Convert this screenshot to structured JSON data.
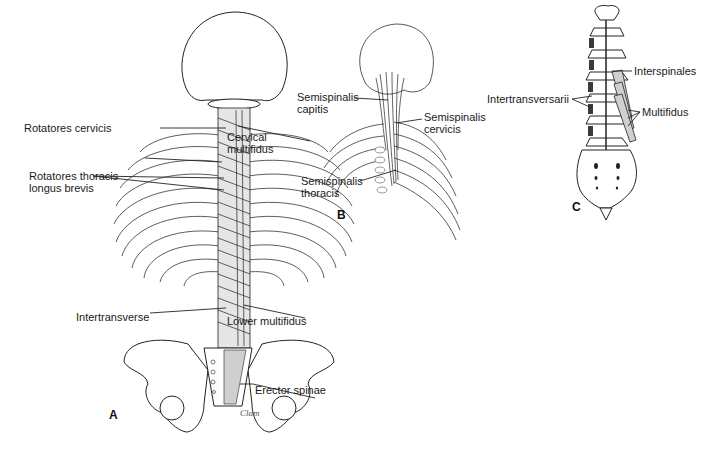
{
  "figure": {
    "panels": [
      {
        "id": "A",
        "letter": "A",
        "labels": {
          "rotatores_cervicis": "Rotatores cervicis",
          "cervical_multifidus_1": "Cervical",
          "cervical_multifidus_2": "multifidus",
          "rotatores_thoracis_1": "Rotatores thoracis",
          "rotatores_thoracis_2": "longus brevis",
          "intertransverse": "Intertransverse",
          "lower_multifidus": "Lower multifidus",
          "erector_spinae": "Erector spinae"
        },
        "signature": "Clam"
      },
      {
        "id": "B",
        "letter": "B",
        "labels": {
          "semispinalis_capitis_1": "Semispinalis",
          "semispinalis_capitis_2": "capitis",
          "semispinalis_cervicis_1": "Semispinalis",
          "semispinalis_cervicis_2": "cervicis",
          "semispinalis_thoracis_1": "Semispinalis",
          "semispinalis_thoracis_2": "thoracis"
        }
      },
      {
        "id": "C",
        "letter": "C",
        "labels": {
          "interspinales": "Interspinales",
          "intertransversarii": "Intertransversarii",
          "multifidus": "Multifidus"
        }
      }
    ]
  }
}
